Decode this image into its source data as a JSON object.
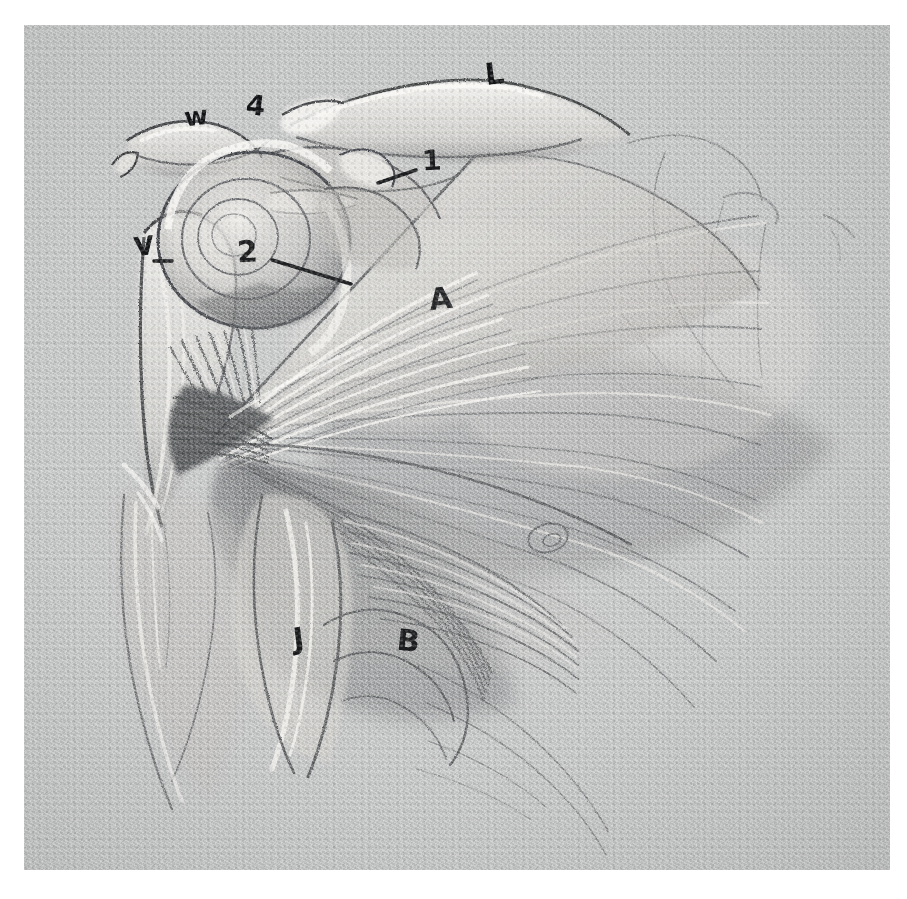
{
  "artwork": {
    "medium": "graphite pencil and white chalk on grey toned paper",
    "subject": "anatomical study of the left shoulder: scapula, clavicle, humeral head, deltoid and pectoral / serratus musculature",
    "paper_color": "#c3c4c4",
    "graphite_color": "#4a4c4e",
    "chalk_color": "#f2f1ee",
    "ink_color": "#111214",
    "border_color": "#ffffff"
  },
  "annotations": [
    {
      "id": "w",
      "text": "w",
      "x": 160,
      "y": 92,
      "size": 26,
      "tilt": "slant",
      "note": "acromion region marker"
    },
    {
      "id": "4",
      "text": "4",
      "x": 222,
      "y": 82,
      "size": 28,
      "tilt": "slant2",
      "note": "clavicle lateral end marker"
    },
    {
      "id": "L",
      "text": "L",
      "x": 461,
      "y": 50,
      "size": 30,
      "tilt": "slant",
      "note": "clavicle / trapezius ridge marker"
    },
    {
      "id": "1",
      "text": "1",
      "x": 398,
      "y": 137,
      "size": 28,
      "tilt": "slant3",
      "note": "coracoid process, leader line points left"
    },
    {
      "id": "V",
      "text": "V",
      "x": 110,
      "y": 222,
      "size": 26,
      "tilt": "slant",
      "note": "lateral border of scapula marker"
    },
    {
      "id": "2",
      "text": "2",
      "x": 213,
      "y": 228,
      "size": 30,
      "tilt": "slant3",
      "note": "humeral head, leader line points down-right"
    },
    {
      "id": "A",
      "text": "A",
      "x": 405,
      "y": 275,
      "size": 30,
      "tilt": "slant",
      "note": "deltoid muscle"
    },
    {
      "id": "J",
      "text": "J",
      "x": 269,
      "y": 615,
      "size": 30,
      "tilt": "slant",
      "note": "biceps / long head marker"
    },
    {
      "id": "B",
      "text": "B",
      "x": 373,
      "y": 617,
      "size": 30,
      "tilt": "slant2",
      "note": "pectoralis major lower border"
    }
  ],
  "leader_lines": [
    {
      "id": "leader-1",
      "for": "1",
      "x1": 354,
      "y1": 158,
      "x2": 392,
      "y2": 145
    },
    {
      "id": "leader-2",
      "for": "2",
      "x1": 248,
      "y1": 235,
      "x2": 327,
      "y2": 259
    },
    {
      "id": "leader-V",
      "for": "V",
      "x1": 130,
      "y1": 236,
      "x2": 148,
      "y2": 236
    }
  ]
}
